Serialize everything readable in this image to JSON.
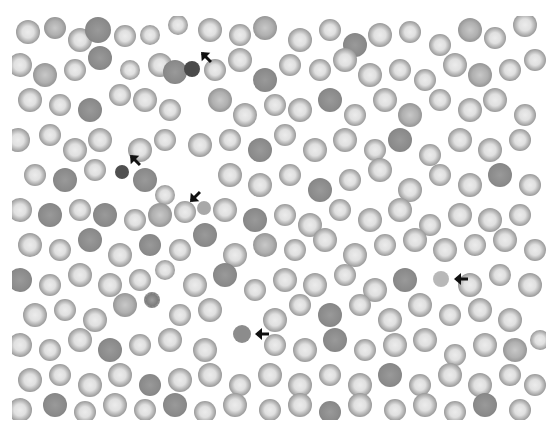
{
  "image": {
    "description": "Grayscale blood smear micrograph with red blood cells; arrows mark five distinct cells",
    "region": {
      "x": 12,
      "y": 16,
      "width": 534,
      "height": 404
    },
    "colors": {
      "background": "#ffffff",
      "cell_rim": "#8a8a8a",
      "cell_center": "#e6e6e6",
      "dense_cell": "#6e6e6e",
      "arrow": "#111111"
    }
  },
  "marked_cells": [
    {
      "id": 1,
      "x": 192,
      "y": 69,
      "r": 8,
      "shade": "#4a4a4a",
      "arrow": {
        "x": 197,
        "y": 48,
        "angle": 225
      }
    },
    {
      "id": 2,
      "x": 122,
      "y": 172,
      "r": 7,
      "shade": "#505050",
      "arrow": {
        "x": 126,
        "y": 151,
        "angle": 225
      }
    },
    {
      "id": 3,
      "x": 204,
      "y": 208,
      "r": 7,
      "shade": "#a8a8a8",
      "arrow": {
        "x": 186,
        "y": 188,
        "angle": 135
      }
    },
    {
      "id": 4,
      "x": 441,
      "y": 279,
      "r": 8,
      "shade": "#b8b8b8",
      "arrow": {
        "x": 452,
        "y": 270,
        "angle": 180
      }
    },
    {
      "id": 5,
      "x": 242,
      "y": 334,
      "r": 9,
      "shade": "#8c8c8c",
      "arrow": {
        "x": 253,
        "y": 325,
        "angle": 180
      }
    }
  ],
  "cells": [
    [
      28,
      32,
      12,
      0
    ],
    [
      55,
      28,
      11,
      1
    ],
    [
      80,
      40,
      12,
      0
    ],
    [
      98,
      30,
      13,
      2
    ],
    [
      125,
      36,
      11,
      0
    ],
    [
      150,
      35,
      10,
      0
    ],
    [
      178,
      25,
      10,
      0
    ],
    [
      210,
      30,
      12,
      0
    ],
    [
      240,
      35,
      11,
      0
    ],
    [
      265,
      28,
      12,
      1
    ],
    [
      300,
      40,
      12,
      0
    ],
    [
      330,
      30,
      11,
      0
    ],
    [
      355,
      45,
      12,
      2
    ],
    [
      380,
      35,
      12,
      0
    ],
    [
      410,
      32,
      11,
      0
    ],
    [
      440,
      45,
      11,
      0
    ],
    [
      470,
      30,
      12,
      1
    ],
    [
      495,
      38,
      11,
      0
    ],
    [
      525,
      25,
      12,
      0
    ],
    [
      20,
      65,
      12,
      0
    ],
    [
      45,
      75,
      12,
      1
    ],
    [
      75,
      70,
      11,
      0
    ],
    [
      100,
      58,
      12,
      2
    ],
    [
      130,
      70,
      10,
      0
    ],
    [
      160,
      65,
      12,
      0
    ],
    [
      175,
      72,
      12,
      2
    ],
    [
      215,
      70,
      11,
      0
    ],
    [
      240,
      60,
      12,
      0
    ],
    [
      265,
      80,
      12,
      2
    ],
    [
      290,
      65,
      11,
      0
    ],
    [
      320,
      70,
      11,
      0
    ],
    [
      345,
      60,
      12,
      0
    ],
    [
      370,
      75,
      12,
      0
    ],
    [
      400,
      70,
      11,
      0
    ],
    [
      425,
      80,
      11,
      0
    ],
    [
      455,
      65,
      12,
      0
    ],
    [
      480,
      75,
      12,
      1
    ],
    [
      510,
      70,
      11,
      0
    ],
    [
      535,
      60,
      11,
      0
    ],
    [
      30,
      100,
      12,
      0
    ],
    [
      60,
      105,
      11,
      0
    ],
    [
      90,
      110,
      12,
      2
    ],
    [
      120,
      95,
      11,
      0
    ],
    [
      145,
      100,
      12,
      0
    ],
    [
      170,
      110,
      11,
      0
    ],
    [
      220,
      100,
      12,
      1
    ],
    [
      245,
      115,
      12,
      0
    ],
    [
      275,
      105,
      11,
      0
    ],
    [
      300,
      110,
      12,
      0
    ],
    [
      330,
      100,
      12,
      2
    ],
    [
      355,
      115,
      11,
      0
    ],
    [
      385,
      100,
      12,
      0
    ],
    [
      410,
      115,
      12,
      1
    ],
    [
      440,
      100,
      11,
      0
    ],
    [
      470,
      110,
      12,
      0
    ],
    [
      495,
      100,
      12,
      0
    ],
    [
      525,
      115,
      11,
      0
    ],
    [
      18,
      140,
      12,
      0
    ],
    [
      50,
      135,
      11,
      0
    ],
    [
      75,
      150,
      12,
      0
    ],
    [
      100,
      140,
      12,
      0
    ],
    [
      140,
      150,
      12,
      0
    ],
    [
      165,
      140,
      11,
      0
    ],
    [
      200,
      145,
      12,
      0
    ],
    [
      230,
      140,
      11,
      0
    ],
    [
      260,
      150,
      12,
      2
    ],
    [
      285,
      135,
      11,
      0
    ],
    [
      315,
      150,
      12,
      0
    ],
    [
      345,
      140,
      12,
      0
    ],
    [
      375,
      150,
      11,
      0
    ],
    [
      400,
      140,
      12,
      2
    ],
    [
      430,
      155,
      11,
      0
    ],
    [
      460,
      140,
      12,
      0
    ],
    [
      490,
      150,
      12,
      0
    ],
    [
      520,
      140,
      11,
      0
    ],
    [
      35,
      175,
      11,
      0
    ],
    [
      65,
      180,
      12,
      2
    ],
    [
      95,
      170,
      11,
      0
    ],
    [
      145,
      180,
      12,
      2
    ],
    [
      165,
      195,
      10,
      0
    ],
    [
      230,
      175,
      12,
      0
    ],
    [
      260,
      185,
      12,
      0
    ],
    [
      290,
      175,
      11,
      0
    ],
    [
      320,
      190,
      12,
      2
    ],
    [
      350,
      180,
      11,
      0
    ],
    [
      380,
      170,
      12,
      0
    ],
    [
      410,
      190,
      12,
      0
    ],
    [
      440,
      175,
      11,
      0
    ],
    [
      470,
      185,
      12,
      0
    ],
    [
      500,
      175,
      12,
      2
    ],
    [
      530,
      185,
      11,
      0
    ],
    [
      20,
      210,
      12,
      0
    ],
    [
      50,
      215,
      12,
      2
    ],
    [
      80,
      210,
      11,
      0
    ],
    [
      105,
      215,
      12,
      2
    ],
    [
      135,
      220,
      11,
      0
    ],
    [
      160,
      215,
      12,
      1
    ],
    [
      185,
      212,
      11,
      0
    ],
    [
      225,
      210,
      12,
      0
    ],
    [
      255,
      220,
      12,
      2
    ],
    [
      285,
      215,
      11,
      0
    ],
    [
      310,
      225,
      12,
      0
    ],
    [
      340,
      210,
      11,
      0
    ],
    [
      370,
      220,
      12,
      0
    ],
    [
      400,
      210,
      12,
      0
    ],
    [
      430,
      225,
      11,
      0
    ],
    [
      460,
      215,
      12,
      0
    ],
    [
      490,
      220,
      12,
      0
    ],
    [
      520,
      215,
      11,
      0
    ],
    [
      30,
      245,
      12,
      0
    ],
    [
      60,
      250,
      11,
      0
    ],
    [
      90,
      240,
      12,
      2
    ],
    [
      120,
      255,
      12,
      0
    ],
    [
      150,
      245,
      11,
      2
    ],
    [
      180,
      250,
      11,
      0
    ],
    [
      205,
      235,
      12,
      2
    ],
    [
      235,
      255,
      12,
      0
    ],
    [
      265,
      245,
      12,
      1
    ],
    [
      295,
      250,
      11,
      0
    ],
    [
      325,
      240,
      12,
      0
    ],
    [
      355,
      255,
      12,
      0
    ],
    [
      385,
      245,
      11,
      0
    ],
    [
      415,
      240,
      12,
      0
    ],
    [
      445,
      250,
      12,
      0
    ],
    [
      475,
      245,
      11,
      0
    ],
    [
      505,
      240,
      12,
      0
    ],
    [
      535,
      250,
      11,
      0
    ],
    [
      20,
      280,
      12,
      2
    ],
    [
      50,
      285,
      11,
      0
    ],
    [
      80,
      275,
      12,
      0
    ],
    [
      110,
      285,
      12,
      0
    ],
    [
      140,
      280,
      11,
      0
    ],
    [
      165,
      270,
      10,
      0
    ],
    [
      195,
      285,
      12,
      0
    ],
    [
      225,
      275,
      12,
      2
    ],
    [
      255,
      290,
      11,
      0
    ],
    [
      285,
      280,
      12,
      0
    ],
    [
      315,
      285,
      12,
      0
    ],
    [
      345,
      275,
      11,
      0
    ],
    [
      375,
      290,
      12,
      0
    ],
    [
      405,
      280,
      12,
      2
    ],
    [
      470,
      285,
      12,
      0
    ],
    [
      500,
      275,
      11,
      0
    ],
    [
      530,
      285,
      12,
      0
    ],
    [
      35,
      315,
      12,
      0
    ],
    [
      65,
      310,
      11,
      0
    ],
    [
      95,
      320,
      12,
      0
    ],
    [
      125,
      305,
      12,
      1
    ],
    [
      152,
      300,
      8,
      3
    ],
    [
      180,
      315,
      11,
      0
    ],
    [
      210,
      310,
      12,
      0
    ],
    [
      275,
      320,
      12,
      0
    ],
    [
      300,
      305,
      11,
      0
    ],
    [
      330,
      315,
      12,
      2
    ],
    [
      360,
      305,
      11,
      0
    ],
    [
      390,
      320,
      12,
      0
    ],
    [
      420,
      305,
      12,
      0
    ],
    [
      450,
      315,
      11,
      0
    ],
    [
      480,
      310,
      12,
      0
    ],
    [
      510,
      320,
      12,
      0
    ],
    [
      20,
      345,
      12,
      0
    ],
    [
      50,
      350,
      11,
      0
    ],
    [
      80,
      340,
      12,
      0
    ],
    [
      110,
      350,
      12,
      2
    ],
    [
      140,
      345,
      11,
      0
    ],
    [
      170,
      340,
      12,
      0
    ],
    [
      205,
      350,
      12,
      0
    ],
    [
      275,
      345,
      11,
      0
    ],
    [
      305,
      350,
      12,
      0
    ],
    [
      335,
      340,
      12,
      2
    ],
    [
      365,
      350,
      11,
      0
    ],
    [
      395,
      345,
      12,
      0
    ],
    [
      425,
      340,
      12,
      0
    ],
    [
      455,
      355,
      11,
      0
    ],
    [
      485,
      345,
      12,
      0
    ],
    [
      515,
      350,
      12,
      1
    ],
    [
      540,
      340,
      10,
      0
    ],
    [
      30,
      380,
      12,
      0
    ],
    [
      60,
      375,
      11,
      0
    ],
    [
      90,
      385,
      12,
      0
    ],
    [
      120,
      375,
      12,
      0
    ],
    [
      150,
      385,
      11,
      2
    ],
    [
      180,
      380,
      12,
      0
    ],
    [
      210,
      375,
      12,
      0
    ],
    [
      240,
      385,
      11,
      0
    ],
    [
      270,
      375,
      12,
      0
    ],
    [
      300,
      385,
      12,
      0
    ],
    [
      330,
      375,
      11,
      0
    ],
    [
      360,
      385,
      12,
      0
    ],
    [
      390,
      375,
      12,
      2
    ],
    [
      420,
      385,
      11,
      0
    ],
    [
      450,
      375,
      12,
      0
    ],
    [
      480,
      385,
      12,
      0
    ],
    [
      510,
      375,
      11,
      0
    ],
    [
      535,
      385,
      11,
      0
    ],
    [
      20,
      410,
      12,
      0
    ],
    [
      55,
      405,
      12,
      2
    ],
    [
      85,
      412,
      11,
      0
    ],
    [
      115,
      405,
      12,
      0
    ],
    [
      145,
      410,
      11,
      0
    ],
    [
      175,
      405,
      12,
      2
    ],
    [
      205,
      412,
      11,
      0
    ],
    [
      235,
      405,
      12,
      0
    ],
    [
      270,
      410,
      11,
      0
    ],
    [
      300,
      405,
      12,
      0
    ],
    [
      330,
      412,
      11,
      2
    ],
    [
      360,
      405,
      12,
      0
    ],
    [
      395,
      410,
      11,
      0
    ],
    [
      425,
      405,
      12,
      0
    ],
    [
      455,
      412,
      11,
      0
    ],
    [
      485,
      405,
      12,
      2
    ],
    [
      520,
      410,
      11,
      0
    ]
  ]
}
